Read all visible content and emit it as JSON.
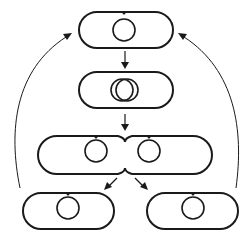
{
  "diagram": {
    "stroke_color": "#1a1a1a",
    "background": "#ffffff",
    "stages": [
      {
        "id": "parent-cell",
        "label": "Cell with single chromosome",
        "chromosomes": 1
      },
      {
        "id": "replicating-cell",
        "label": "Chromosome replication",
        "chromosomes": 2
      },
      {
        "id": "dividing-cell",
        "label": "Septum forming / cell constriction",
        "chromosomes": 2
      },
      {
        "id": "daughter-cell-left",
        "label": "Daughter cell",
        "chromosomes": 1
      },
      {
        "id": "daughter-cell-right",
        "label": "Daughter cell",
        "chromosomes": 1
      }
    ],
    "arrows": [
      {
        "from": "parent-cell",
        "to": "replicating-cell",
        "style": "straight"
      },
      {
        "from": "replicating-cell",
        "to": "dividing-cell",
        "style": "straight"
      },
      {
        "from": "dividing-cell",
        "to": "daughter-cell-left",
        "style": "diagonal"
      },
      {
        "from": "dividing-cell",
        "to": "daughter-cell-right",
        "style": "diagonal"
      },
      {
        "from": "daughter-cell-left",
        "to": "parent-cell",
        "style": "curved"
      },
      {
        "from": "daughter-cell-right",
        "to": "parent-cell",
        "style": "curved"
      }
    ]
  }
}
